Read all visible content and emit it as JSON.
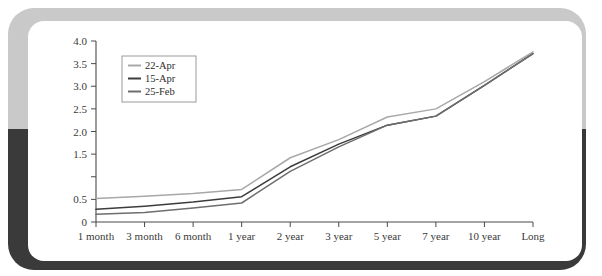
{
  "card": {
    "frame_top_color": "#c9c9c9",
    "frame_bottom_color": "#3a3a3a",
    "background_color": "#ffffff"
  },
  "chart_data": {
    "type": "line",
    "title": "",
    "xlabel": "",
    "ylabel": "",
    "ylim": [
      0,
      4.0
    ],
    "grid": false,
    "legend_position": "upper-left",
    "categories": [
      "1 month",
      "3 month",
      "6 month",
      "1 year",
      "2 year",
      "3 year",
      "5 year",
      "7 year",
      "10 year",
      "Long"
    ],
    "ytick_labels": [
      "0",
      "0.5",
      "",
      "1.5",
      "2.0",
      "2.5",
      "3.0",
      "3.5",
      "4.0"
    ],
    "ytick_values": [
      0,
      0.5,
      1.0,
      1.5,
      2.0,
      2.5,
      3.0,
      3.5,
      4.0
    ],
    "series": [
      {
        "name": "22-Apr",
        "color": "#a8a8a8",
        "values": [
          0.52,
          0.57,
          0.63,
          0.72,
          1.42,
          1.82,
          2.32,
          2.5,
          3.1,
          3.76
        ]
      },
      {
        "name": "15-Apr",
        "color": "#3c3c3c",
        "values": [
          0.28,
          0.35,
          0.44,
          0.56,
          1.22,
          1.72,
          2.14,
          2.34,
          3.02,
          3.72
        ]
      },
      {
        "name": "25-Feb",
        "color": "#6e6e6e",
        "values": [
          0.17,
          0.21,
          0.31,
          0.42,
          1.12,
          1.66,
          2.14,
          2.34,
          3.02,
          3.72
        ]
      }
    ]
  }
}
